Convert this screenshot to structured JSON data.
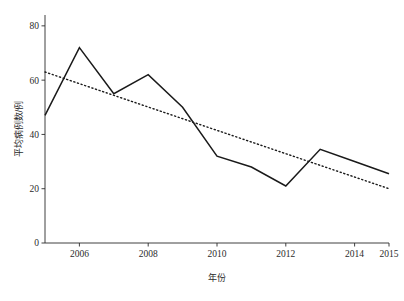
{
  "chart_data": {
    "type": "line",
    "title": "",
    "xlabel": "年份",
    "ylabel": "平均病例数/例",
    "x": [
      2005,
      2006,
      2007,
      2008,
      2009,
      2010,
      2011,
      2012,
      2013,
      2014,
      2015
    ],
    "xlim": [
      2005,
      2015
    ],
    "ylim": [
      0,
      84
    ],
    "grid": false,
    "legend": "none",
    "xticks": [
      "2006",
      "2008",
      "2010",
      "2012",
      "2014",
      "2015"
    ],
    "xtick_values": [
      2006,
      2008,
      2010,
      2012,
      2014,
      2015
    ],
    "yticks": [
      "0",
      "20",
      "40",
      "60",
      "80"
    ],
    "ytick_values": [
      0,
      20,
      40,
      60,
      80
    ],
    "series": [
      {
        "name": "平均病例数",
        "style": "solid",
        "values": [
          47,
          72,
          55,
          62,
          50,
          32,
          28,
          21,
          34.5,
          30,
          25.5
        ]
      },
      {
        "name": "趋势线",
        "style": "dotted",
        "x": [
          2005,
          2015
        ],
        "values": [
          63,
          20
        ]
      }
    ]
  }
}
